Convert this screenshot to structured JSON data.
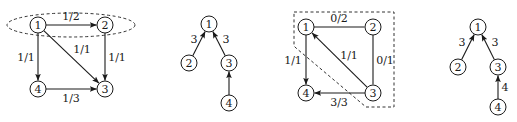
{
  "figure": {
    "type": "graph-diagrams",
    "colors": {
      "ink": "#1a1a1a",
      "background": "#ffffff",
      "dashed": "#333333"
    },
    "panels": [
      {
        "id": "flow-network-a",
        "nodes": [
          {
            "id": "1",
            "label": "1",
            "x": 38,
            "y": 25
          },
          {
            "id": "2",
            "label": "2",
            "x": 105,
            "y": 25
          },
          {
            "id": "3",
            "label": "3",
            "x": 105,
            "y": 89
          },
          {
            "id": "4",
            "label": "4",
            "x": 38,
            "y": 89
          }
        ],
        "edges": [
          {
            "from": "1",
            "to": "2",
            "label": "1/2",
            "directed": true,
            "lx": 71,
            "ly": 16
          },
          {
            "from": "1",
            "to": "4",
            "label": "1/1",
            "directed": true,
            "lx": 26,
            "ly": 57
          },
          {
            "from": "1",
            "to": "3",
            "label": "1/1",
            "directed": true,
            "lx": 82,
            "ly": 49
          },
          {
            "from": "2",
            "to": "3",
            "label": "1/1",
            "directed": true,
            "lx": 117,
            "ly": 57
          },
          {
            "from": "4",
            "to": "3",
            "label": "1/3",
            "directed": true,
            "lx": 71,
            "ly": 98
          }
        ],
        "highlight": {
          "shape": "dashed-ellipse",
          "cx": 71,
          "cy": 25,
          "rx": 64,
          "ry": 12,
          "contains": [
            "1",
            "2"
          ]
        }
      },
      {
        "id": "tree-b",
        "nodes": [
          {
            "id": "1",
            "label": "1",
            "x": 209,
            "y": 24
          },
          {
            "id": "2",
            "label": "2",
            "x": 189,
            "y": 63
          },
          {
            "id": "3",
            "label": "3",
            "x": 229,
            "y": 63
          },
          {
            "id": "4",
            "label": "4",
            "x": 229,
            "y": 103
          }
        ],
        "edges": [
          {
            "from": "2",
            "to": "1",
            "label": "3",
            "directed": true,
            "lx": 194,
            "ly": 39
          },
          {
            "from": "3",
            "to": "1",
            "label": "3",
            "directed": true,
            "lx": 226,
            "ly": 39
          },
          {
            "from": "4",
            "to": "3",
            "label": "",
            "directed": true,
            "lx": 0,
            "ly": 0
          }
        ]
      },
      {
        "id": "flow-network-c",
        "nodes": [
          {
            "id": "1",
            "label": "1",
            "x": 306,
            "y": 27
          },
          {
            "id": "2",
            "label": "2",
            "x": 373,
            "y": 27
          },
          {
            "id": "3",
            "label": "3",
            "x": 373,
            "y": 93
          },
          {
            "id": "4",
            "label": "4",
            "x": 306,
            "y": 93
          }
        ],
        "edges": [
          {
            "from": "1",
            "to": "2",
            "label": "0/2",
            "directed": false,
            "lx": 339,
            "ly": 18
          },
          {
            "from": "1",
            "to": "4",
            "label": "1/1",
            "directed": true,
            "lx": 293,
            "ly": 60
          },
          {
            "from": "3",
            "to": "1",
            "label": "1/1",
            "directed": true,
            "lx": 349,
            "ly": 55
          },
          {
            "from": "2",
            "to": "3",
            "label": "0/1",
            "directed": false,
            "lx": 385,
            "ly": 60
          },
          {
            "from": "3",
            "to": "4",
            "label": "3/3",
            "directed": true,
            "lx": 339,
            "ly": 102
          }
        ],
        "highlight": {
          "shape": "dashed-polygon",
          "points": "294,12 394,12 394,107 366,107 296,48 294,46",
          "contains": [
            "1",
            "2",
            "3"
          ]
        }
      },
      {
        "id": "tree-d",
        "nodes": [
          {
            "id": "1",
            "label": "1",
            "x": 478,
            "y": 27
          },
          {
            "id": "2",
            "label": "2",
            "x": 458,
            "y": 67
          },
          {
            "id": "3",
            "label": "3",
            "x": 498,
            "y": 67
          },
          {
            "id": "4",
            "label": "4",
            "x": 498,
            "y": 107
          }
        ],
        "edges": [
          {
            "from": "2",
            "to": "1",
            "label": "3",
            "directed": true,
            "lx": 462,
            "ly": 42
          },
          {
            "from": "3",
            "to": "1",
            "label": "3",
            "directed": true,
            "lx": 495,
            "ly": 42
          },
          {
            "from": "4",
            "to": "3",
            "label": "4",
            "directed": true,
            "lx": 505,
            "ly": 87
          }
        ]
      }
    ]
  }
}
